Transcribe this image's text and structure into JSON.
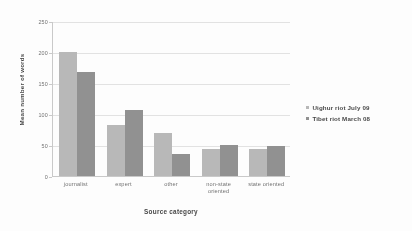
{
  "chart_data": {
    "type": "bar",
    "title": "",
    "xlabel": "Source category",
    "ylabel": "Mean number of words",
    "categories": [
      "journalist",
      "expert",
      "other",
      "non-state oriented",
      "state oriented"
    ],
    "series": [
      {
        "name": "Uighur riot July 09",
        "color": "#b6b6b6",
        "values": [
          200,
          83,
          70,
          44,
          43
        ]
      },
      {
        "name": "Tibet riot March 08",
        "color": "#8e8e8e",
        "values": [
          168,
          107,
          35,
          50,
          48
        ]
      }
    ],
    "ylim": [
      0,
      250
    ],
    "yticks": [
      0,
      50,
      100,
      150,
      200,
      250
    ],
    "ytick_labels": [
      "0",
      "50",
      "100",
      "150",
      "200",
      "250"
    ],
    "grid": "horizontal",
    "legend_position": "right"
  }
}
